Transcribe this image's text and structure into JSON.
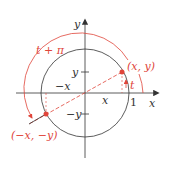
{
  "diagram": {
    "axis_labels": {
      "x": "x",
      "y": "y"
    },
    "tick_labels": {
      "one": "1",
      "x": "x",
      "neg_x": "−x",
      "y": "y",
      "neg_y": "−y"
    },
    "points": {
      "p": "(x, y)",
      "q": "(−x, −y)"
    },
    "angles": {
      "t": "t",
      "t_plus_pi": "t + π"
    },
    "colors": {
      "accent": "#e0453a",
      "line": "#333333"
    }
  }
}
